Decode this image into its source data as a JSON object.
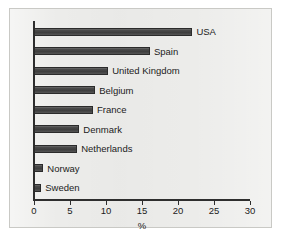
{
  "chart_data": {
    "type": "bar",
    "orientation": "horizontal",
    "title": "",
    "subtitle": "",
    "xlabel": "%",
    "ylabel": "",
    "xlim": [
      0,
      30
    ],
    "xticks": [
      0,
      5,
      10,
      15,
      20,
      25,
      30
    ],
    "xtick_labels": [
      "0",
      "5",
      "10",
      "15",
      "20",
      "25",
      "30"
    ],
    "grid": false,
    "legend": false,
    "categories": [
      "USA",
      "Spain",
      "United Kingdom",
      "Belgium",
      "France",
      "Denmark",
      "Netherlands",
      "Norway",
      "Sweden"
    ],
    "values": [
      22.0,
      16.1,
      10.3,
      8.5,
      8.2,
      6.3,
      6.0,
      1.3,
      1.0
    ],
    "series": [
      {
        "name": "",
        "values": [
          22.0,
          16.1,
          10.3,
          8.5,
          8.2,
          6.3,
          6.0,
          1.3,
          1.0
        ]
      }
    ],
    "bar_color": "#4a4a4a",
    "bar_edge_color": "#2b2b2b",
    "axis_color": "#2e2e2e",
    "background_color": "#ececea",
    "label_color": "#1b1b1b"
  },
  "figure": {
    "plate_background": "#ececea",
    "plate_border": "#c9c9c5",
    "page_background": "#ffffff"
  }
}
